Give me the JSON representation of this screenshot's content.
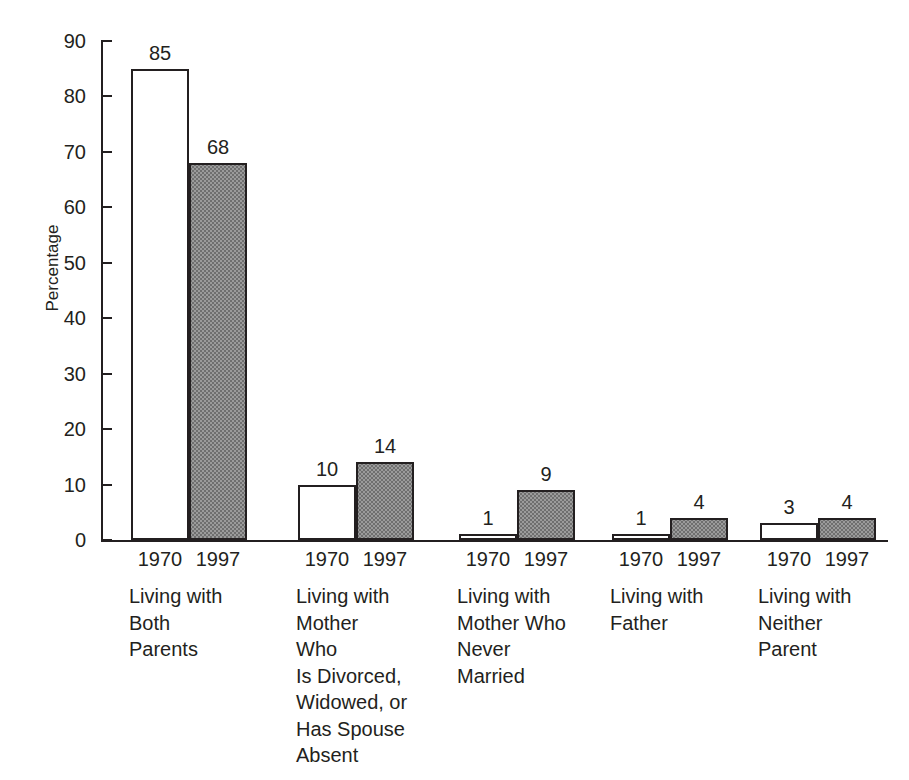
{
  "figure": {
    "title_remnant": "",
    "background_color": "#ffffff",
    "ink_color": "#231f20",
    "bar_1970_fill": "#ffffff",
    "bar_1997_fill": "#9b9b9b"
  },
  "axes": {
    "y_title": "Percentage",
    "y_ticks": [
      "90",
      "80",
      "70",
      "60",
      "50",
      "40",
      "30",
      "20",
      "10",
      "0"
    ],
    "y_min": 0,
    "y_max": 90,
    "y_step": 10
  },
  "groups": [
    {
      "category": "Living with\nBoth\nParents",
      "bars": [
        {
          "year": "1970",
          "value": 85,
          "label": "85",
          "style": "white"
        },
        {
          "year": "1997",
          "value": 68,
          "label": "68",
          "style": "gray"
        }
      ]
    },
    {
      "category": "Living with\nMother\nWho\nIs Divorced,\nWidowed, or\nHas Spouse\nAbsent",
      "bars": [
        {
          "year": "1970",
          "value": 10,
          "label": "10",
          "style": "white"
        },
        {
          "year": "1997",
          "value": 14,
          "label": "14",
          "style": "gray"
        }
      ]
    },
    {
      "category": "Living with\nMother Who\nNever\nMarried",
      "bars": [
        {
          "year": "1970",
          "value": 1,
          "label": "1",
          "style": "white"
        },
        {
          "year": "1997",
          "value": 9,
          "label": "9",
          "style": "gray"
        }
      ]
    },
    {
      "category": "Living with\nFather",
      "bars": [
        {
          "year": "1970",
          "value": 1,
          "label": "1",
          "style": "white"
        },
        {
          "year": "1997",
          "value": 4,
          "label": "4",
          "style": "gray"
        }
      ]
    },
    {
      "category": "Living with\nNeither\nParent",
      "bars": [
        {
          "year": "1970",
          "value": 3,
          "label": "3",
          "style": "white"
        },
        {
          "year": "1997",
          "value": 4,
          "label": "4",
          "style": "gray"
        }
      ]
    }
  ],
  "chart_data": {
    "type": "bar",
    "title": "",
    "xlabel": "",
    "ylabel": "Percentage",
    "ylim": [
      0,
      90
    ],
    "ytick_step": 10,
    "grid": false,
    "legend": "none",
    "categories": [
      "Living with Both Parents",
      "Living with Mother Who Is Divorced, Widowed, or Has Spouse Absent",
      "Living with Mother Who Never Married",
      "Living with Father",
      "Living with Neither Parent"
    ],
    "series": [
      {
        "name": "1970",
        "values": [
          85,
          10,
          1,
          1,
          3
        ],
        "fill": "#ffffff"
      },
      {
        "name": "1997",
        "values": [
          68,
          14,
          9,
          4,
          4
        ],
        "fill": "#9b9b9b"
      }
    ],
    "data_labels": [
      [
        "85",
        "68"
      ],
      [
        "10",
        "14"
      ],
      [
        "1",
        "9"
      ],
      [
        "1",
        "4"
      ],
      [
        "3",
        "4"
      ]
    ]
  }
}
